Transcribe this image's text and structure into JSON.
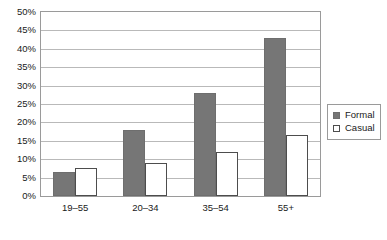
{
  "chart_data": {
    "type": "bar",
    "title": "",
    "xlabel": "",
    "ylabel": "",
    "categories": [
      "19–55",
      "20–34",
      "35–54",
      "55+"
    ],
    "series": [
      {
        "name": "Formal",
        "values": [
          6.5,
          18,
          28,
          43
        ],
        "color": "#767676"
      },
      {
        "name": "Casual",
        "values": [
          7.5,
          9,
          12,
          16.5
        ],
        "color": "#ffffff"
      }
    ],
    "ylim": [
      0,
      50
    ],
    "ytick_step": 5,
    "ytick_labels": [
      "0%",
      "5%",
      "10%",
      "15%",
      "20%",
      "25%",
      "30%",
      "35%",
      "40%",
      "45%",
      "50%"
    ],
    "grid": true,
    "legend_position": "right"
  },
  "legend": {
    "items": [
      {
        "label": "Formal",
        "swatch": "filled-square-icon"
      },
      {
        "label": "Casual",
        "swatch": "outlined-square-icon"
      }
    ]
  }
}
